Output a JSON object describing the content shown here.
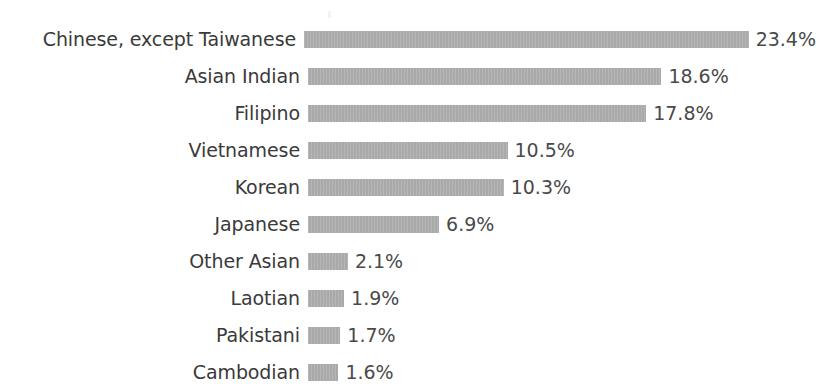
{
  "chart_data": {
    "type": "bar",
    "orientation": "horizontal",
    "title": "",
    "subtitle": "",
    "xlabel": "",
    "ylabel": "",
    "grid": false,
    "legend": "none",
    "xlim": [
      0,
      23.4
    ],
    "value_suffix": "%",
    "categories": [
      "Chinese, except Taiwanese",
      "Asian Indian",
      "Filipino",
      "Vietnamese",
      "Korean",
      "Japanese",
      "Other Asian",
      "Laotian",
      "Pakistani",
      "Cambodian"
    ],
    "values": [
      23.4,
      18.6,
      17.8,
      10.5,
      10.3,
      6.9,
      2.1,
      1.9,
      1.7,
      1.6
    ],
    "value_labels": [
      "23.4%",
      "18.6%",
      "17.8%",
      "10.5%",
      "10.3%",
      "6.9%",
      "2.1%",
      "1.9%",
      "1.7%",
      "1.6%"
    ],
    "bar_color": "#a9a9a9",
    "label_color": "#3a3a3a",
    "background_color": "#ffffff"
  },
  "layout": {
    "label_column_width": 300,
    "bar_start_x": 308,
    "px_per_percent": 19.0,
    "row_height": 37,
    "first_row_top": 24,
    "bar_height": 17
  }
}
